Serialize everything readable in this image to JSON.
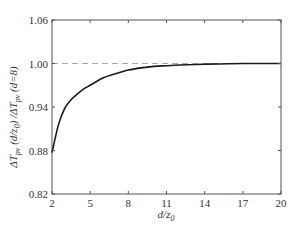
{
  "chart_data": {
    "type": "line",
    "title": "",
    "xlabel": "d/z0",
    "ylabel": "ΔT_pv (d/z0) /ΔT_pv (d=8)",
    "xlim": [
      2,
      20
    ],
    "ylim": [
      0.82,
      1.06
    ],
    "xticks": [
      2,
      5,
      8,
      11,
      14,
      17,
      20
    ],
    "xtick_labels": [
      "2",
      "5",
      "8",
      "11",
      "14",
      "17",
      "20"
    ],
    "yticks": [
      0.82,
      0.88,
      0.94,
      1.0,
      1.06
    ],
    "ytick_labels": [
      "0.82",
      "0.88",
      "0.94",
      "1.00",
      "1.06"
    ],
    "grid": false,
    "legend": null,
    "reference_line": {
      "y": 1.0,
      "style": "dashed",
      "color": "#aaaaaa"
    },
    "series": [
      {
        "name": "ratio",
        "color": "#1a1a1a",
        "x": [
          2,
          2.5,
          3,
          3.5,
          4,
          4.5,
          5,
          6,
          7,
          8,
          9,
          10,
          11,
          12,
          14,
          17,
          20
        ],
        "values": [
          0.877,
          0.915,
          0.938,
          0.95,
          0.958,
          0.965,
          0.97,
          0.98,
          0.986,
          0.991,
          0.994,
          0.996,
          0.997,
          0.998,
          0.999,
          1.0,
          1.0
        ]
      }
    ]
  },
  "labels": {
    "x_axis_main": "d/z",
    "x_axis_sub": "0",
    "y_axis_parts": [
      "ΔT",
      "pv",
      " (d/z",
      "0",
      ") /ΔT",
      "pv",
      " (d=8)"
    ]
  }
}
